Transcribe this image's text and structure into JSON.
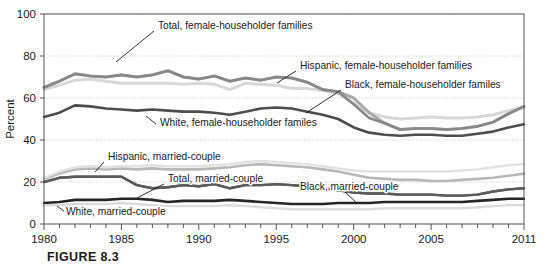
{
  "figure": {
    "caption": "FIGURE 8.3"
  },
  "chart_data": {
    "type": "line",
    "title": "",
    "xlabel": "",
    "ylabel": "Percent",
    "xlim": [
      1980,
      2011
    ],
    "ylim": [
      0,
      100
    ],
    "grid": "horizontal-dotted",
    "legend_position": "inline-annotations",
    "yticks": [
      0,
      20,
      40,
      60,
      80,
      100
    ],
    "xticks": [
      1980,
      1981,
      1982,
      1983,
      1984,
      1985,
      1986,
      1987,
      1988,
      1989,
      1990,
      1991,
      1992,
      1993,
      1994,
      1995,
      1996,
      1997,
      1998,
      1999,
      2000,
      2001,
      2002,
      2003,
      2004,
      2005,
      2006,
      2007,
      2008,
      2009,
      2010,
      2011
    ],
    "xtick_labels": [
      "1980",
      "",
      "",
      "",
      "",
      "1985",
      "",
      "",
      "",
      "",
      "1990",
      "",
      "",
      "",
      "",
      "1995",
      "",
      "",
      "",
      "",
      "2000",
      "",
      "",
      "",
      "",
      "2005",
      "",
      "",
      "",
      "",
      "",
      "2011"
    ],
    "x": [
      1980,
      1981,
      1982,
      1983,
      1984,
      1985,
      1986,
      1987,
      1988,
      1989,
      1990,
      1991,
      1992,
      1993,
      1994,
      1995,
      1996,
      1997,
      1998,
      1999,
      2000,
      2001,
      2002,
      2003,
      2004,
      2005,
      2006,
      2007,
      2008,
      2009,
      2010,
      2011
    ],
    "series": [
      {
        "name": "Total, female-householder families",
        "label": "Total, female-householder families",
        "color": "#4d4d4d",
        "width": 2.6,
        "values": [
          51.0,
          53.0,
          56.5,
          56.0,
          55.0,
          54.5,
          54.0,
          54.5,
          54.0,
          53.5,
          53.5,
          53.0,
          52.0,
          53.5,
          55.0,
          55.5,
          55.0,
          53.5,
          52.0,
          50.0,
          46.0,
          43.5,
          42.5,
          42.0,
          42.5,
          42.5,
          42.0,
          42.0,
          43.0,
          44.0,
          46.0,
          47.5
        ]
      },
      {
        "name": "White, female-householder familes",
        "label": "White, female-householder familes",
        "color": "#d8d8d8",
        "width": 3.0,
        "values": [
          64.0,
          66.0,
          68.5,
          69.0,
          68.0,
          67.0,
          67.0,
          67.0,
          67.0,
          66.5,
          67.0,
          66.5,
          64.0,
          67.0,
          66.5,
          66.0,
          64.5,
          64.5,
          63.5,
          62.0,
          57.5,
          53.0,
          51.0,
          50.0,
          50.5,
          51.0,
          50.5,
          50.5,
          51.0,
          52.0,
          54.0,
          55.5
        ]
      },
      {
        "name": "Hispanic, female-householder families",
        "label": "Hispanic, female-householder families",
        "color": "#a9a9a9",
        "width": 3.0,
        "values": [
          65.0,
          68.0,
          71.5,
          70.5,
          70.0,
          71.0,
          70.0,
          71.0,
          73.0,
          70.0,
          69.0,
          70.5,
          68.0,
          69.5,
          68.5,
          70.0,
          69.5,
          67.5,
          64.0,
          63.0,
          60.0,
          53.0,
          48.0,
          45.0,
          45.5,
          45.5,
          45.0,
          45.5,
          46.5,
          48.5,
          52.5,
          56.0
        ]
      },
      {
        "name": "Black, female-householder familes",
        "label": "Black, female-householder familes",
        "color": "#888888",
        "width": 2.6,
        "values": [
          65.0,
          68.0,
          71.5,
          70.5,
          70.0,
          71.0,
          70.0,
          71.0,
          73.0,
          70.0,
          69.0,
          70.5,
          68.0,
          69.5,
          68.5,
          70.0,
          69.5,
          67.5,
          64.0,
          63.0,
          57.0,
          50.5,
          48.0,
          45.0,
          45.5,
          45.5,
          45.0,
          45.5,
          46.5,
          48.5,
          52.5,
          56.0
        ]
      },
      {
        "name": "Hispanic, married-couple",
        "label": "Hispanic, married-couple",
        "color": "#b8b8b8",
        "width": 2.6,
        "values": [
          21.5,
          24.0,
          26.0,
          26.5,
          26.0,
          26.5,
          26.0,
          26.5,
          26.0,
          26.0,
          26.0,
          26.5,
          27.0,
          28.0,
          28.5,
          28.0,
          27.5,
          27.0,
          26.0,
          25.0,
          23.5,
          22.0,
          21.5,
          21.0,
          21.0,
          20.5,
          20.5,
          21.0,
          21.5,
          22.0,
          23.0,
          24.0
        ]
      },
      {
        "name": "Total, married-couple",
        "label": "Total, married-couple",
        "color": "#5a5a5a",
        "width": 2.4,
        "values": [
          20.0,
          22.0,
          22.5,
          22.5,
          22.5,
          22.5,
          18.5,
          17.0,
          17.5,
          18.5,
          18.0,
          19.0,
          17.0,
          18.5,
          18.5,
          19.0,
          18.5,
          18.0,
          17.0,
          16.0,
          15.0,
          14.5,
          14.5,
          14.0,
          14.0,
          14.0,
          13.5,
          13.5,
          14.0,
          15.5,
          16.5,
          17.0
        ]
      },
      {
        "name": "Black, married-couple",
        "label": "Black, married-couple",
        "color": "#5a5a5a",
        "width": 2.4,
        "values": [
          20.0,
          22.0,
          22.5,
          22.5,
          22.5,
          22.5,
          18.5,
          17.0,
          17.5,
          18.5,
          18.0,
          19.0,
          17.0,
          18.5,
          18.5,
          19.0,
          18.5,
          18.0,
          17.0,
          16.0,
          15.0,
          14.5,
          14.5,
          14.0,
          14.0,
          14.0,
          13.5,
          13.5,
          14.0,
          15.5,
          16.5,
          17.0
        ]
      },
      {
        "name": "White, married-couple",
        "label": "White, married-couple",
        "color": "#262626",
        "width": 2.6,
        "values": [
          10.0,
          10.5,
          11.5,
          11.5,
          11.5,
          12.0,
          12.0,
          11.5,
          10.5,
          11.0,
          11.0,
          11.0,
          11.5,
          11.0,
          10.5,
          10.0,
          9.5,
          9.5,
          9.5,
          10.0,
          10.0,
          10.0,
          10.5,
          10.5,
          10.5,
          10.5,
          10.5,
          10.5,
          11.0,
          11.5,
          12.0,
          12.0
        ]
      },
      {
        "name": "White, married-couple (light)",
        "label": "",
        "color": "#dcdcdc",
        "width": 2.4,
        "values": [
          9.0,
          9.0,
          9.5,
          9.5,
          9.5,
          10.0,
          9.5,
          9.0,
          8.5,
          8.5,
          8.5,
          8.5,
          9.0,
          8.5,
          8.0,
          7.5,
          7.0,
          7.0,
          7.0,
          7.0,
          7.0,
          7.0,
          7.5,
          7.5,
          7.5,
          7.5,
          7.5,
          7.5,
          8.0,
          8.5,
          9.0,
          9.0
        ]
      },
      {
        "name": "Hispanic, married-couple (light upper)",
        "label": "",
        "color": "#e2e2e2",
        "width": 2.4,
        "values": [
          22.0,
          25.0,
          27.0,
          27.5,
          27.0,
          27.5,
          27.5,
          28.0,
          27.5,
          27.5,
          27.5,
          28.0,
          28.5,
          29.5,
          30.0,
          29.5,
          29.0,
          28.5,
          27.5,
          26.5,
          25.5,
          25.0,
          25.0,
          25.0,
          25.0,
          25.0,
          25.0,
          25.5,
          26.0,
          27.0,
          28.0,
          28.5
        ]
      }
    ],
    "annotations": [
      {
        "text": "Total, female-householder families",
        "text_x": 158,
        "text_y": 29,
        "leader": [
          [
            154,
            31
          ],
          [
            116,
            62
          ]
        ]
      },
      {
        "text": "Hispanic, female-householder families",
        "text_x": 300,
        "text_y": 69,
        "leader": [
          [
            296,
            71
          ],
          [
            277,
            83
          ]
        ]
      },
      {
        "text": "Black, female-householder familes",
        "text_x": 345,
        "text_y": 88,
        "leader": [
          [
            341,
            90
          ],
          [
            306,
            113
          ]
        ]
      },
      {
        "text": "White, female-householder familes",
        "text_x": 160,
        "text_y": 126,
        "leader": [
          [
            156,
            124
          ],
          [
            146,
            116
          ]
        ]
      },
      {
        "text": "Hispanic, married-couple",
        "text_x": 108,
        "text_y": 160,
        "leader": [
          [
            104,
            162
          ],
          [
            95,
            172
          ]
        ]
      },
      {
        "text": "Total, married-couple",
        "text_x": 168,
        "text_y": 182,
        "leader": [
          [
            164,
            184
          ],
          [
            137,
            198
          ]
        ]
      },
      {
        "text": "Black, married-couple",
        "text_x": 300,
        "text_y": 190,
        "leader": [
          [
            345,
            192
          ],
          [
            358,
            204
          ]
        ]
      },
      {
        "text": "White, married-couple",
        "text_x": 66,
        "text_y": 215,
        "leader": [
          [
            64,
            211
          ],
          [
            57,
            206
          ]
        ]
      }
    ]
  },
  "colors": {
    "axis": "#6b6b6b",
    "grid": "#bdbdbd",
    "text": "#1a1a1a",
    "plot_background": "#ffffff"
  }
}
